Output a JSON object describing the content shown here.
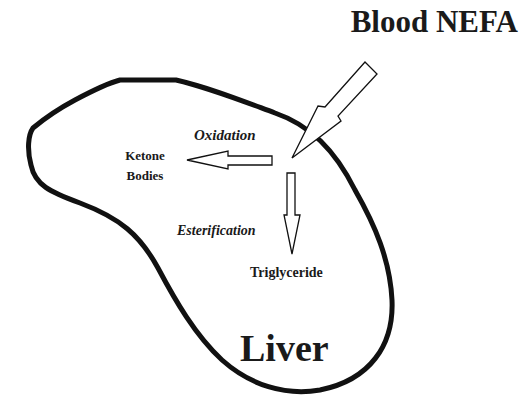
{
  "diagram": {
    "title": "Blood NEFA",
    "organ": "Liver",
    "pathways": [
      {
        "label": "Oxidation",
        "product": "Ketone Bodies",
        "product_lines": [
          "Ketone",
          "Bodies"
        ]
      },
      {
        "label": "Esterification",
        "product": "Triglyceride"
      }
    ],
    "colors": {
      "stroke": "#111111",
      "background": "#ffffff"
    }
  }
}
